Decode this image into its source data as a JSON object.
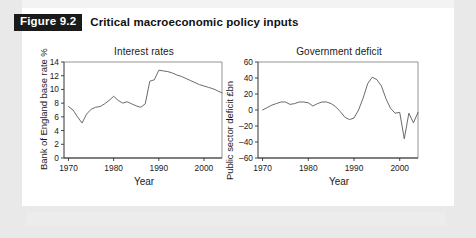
{
  "figure": {
    "tag": "Figure 9.2",
    "title": "Critical macroeconomic policy inputs"
  },
  "chart_data": [
    {
      "type": "line",
      "title": "Interest rates",
      "xlabel": "Year",
      "ylabel": "Bank of England base rate %",
      "xlim": [
        1969,
        2004
      ],
      "ylim": [
        0,
        14
      ],
      "xticks": [
        1970,
        1980,
        1990,
        2000
      ],
      "yticks": [
        0,
        2,
        4,
        6,
        8,
        10,
        12,
        14
      ],
      "grid": false,
      "legend": "none",
      "x": [
        1970,
        1971,
        1972,
        1973,
        1974,
        1975,
        1976,
        1977,
        1978,
        1979,
        1980,
        1981,
        1982,
        1983,
        1984,
        1985,
        1986,
        1987,
        1988,
        1989,
        1990,
        1991,
        1992,
        1993,
        1994,
        1995,
        1996,
        1997,
        1998,
        1999,
        2000,
        2001,
        2002,
        2003,
        2004
      ],
      "values": [
        7.5,
        7.0,
        6.0,
        5.1,
        6.4,
        7.1,
        7.4,
        7.5,
        7.9,
        8.4,
        9.0,
        8.4,
        8.0,
        8.2,
        7.9,
        7.6,
        7.4,
        7.9,
        11.2,
        11.4,
        12.8,
        12.7,
        12.6,
        12.4,
        12.1,
        11.9,
        11.6,
        11.3,
        11.0,
        10.7,
        10.5,
        10.3,
        10.1,
        9.8,
        9.5
      ]
    },
    {
      "type": "line",
      "title": "Government deficit",
      "xlabel": "Year",
      "ylabel": "Public sector deficit £bn",
      "xlim": [
        1969,
        2004
      ],
      "ylim": [
        -60,
        60
      ],
      "xticks": [
        1970,
        1980,
        1990,
        2000
      ],
      "yticks": [
        -60,
        -40,
        -20,
        0,
        20,
        40,
        60
      ],
      "grid": false,
      "legend": "none",
      "x": [
        1970,
        1971,
        1972,
        1973,
        1974,
        1975,
        1976,
        1977,
        1978,
        1979,
        1980,
        1981,
        1982,
        1983,
        1984,
        1985,
        1986,
        1987,
        1988,
        1989,
        1990,
        1991,
        1992,
        1993,
        1994,
        1995,
        1996,
        1997,
        1998,
        1999,
        2000,
        2001,
        2002,
        2003,
        2004
      ],
      "values": [
        0,
        3,
        6,
        8,
        10,
        10,
        7,
        8,
        10,
        10,
        9,
        5,
        8,
        10,
        10,
        8,
        4,
        -2,
        -9,
        -12,
        -10,
        0,
        15,
        33,
        41,
        38,
        30,
        14,
        2,
        -4,
        -3,
        -36,
        -4,
        -16,
        -3
      ]
    }
  ]
}
